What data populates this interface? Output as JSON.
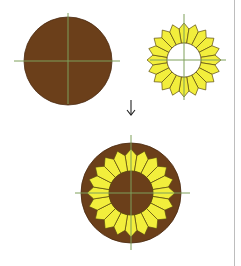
{
  "colors": {
    "brown": "#6b3f1a",
    "brown_edge": "#4a2a10",
    "yellow": "#f2ee3c",
    "petal_edge": "#5a4a10",
    "crosshair": "#7fa05a",
    "divider": "#bdbdbd",
    "arrow": "#222222"
  },
  "petal_count": 20,
  "figures": [
    {
      "id": "brown-disc",
      "cx": 68,
      "cy": 61,
      "disc_r": 44,
      "cross": {
        "x1": 14,
        "x2": 120,
        "y1": 13,
        "y2": 104
      }
    },
    {
      "id": "yellow-ring",
      "cx": 184,
      "cy": 60,
      "petal_inner_r": 17,
      "petal_outer_r": 37,
      "cross": {
        "x1": 150,
        "x2": 226,
        "y1": 14,
        "y2": 100
      }
    },
    {
      "id": "composite",
      "cx": 131,
      "cy": 193,
      "disc_r": 50,
      "petal_inner_r": 22,
      "petal_outer_r": 44,
      "center_r": 22,
      "cross": {
        "x1": 75,
        "x2": 190,
        "y1": 135,
        "y2": 250
      }
    }
  ],
  "arrow": {
    "glyph": "↓",
    "x": 131,
    "y1": 100,
    "y2": 115
  }
}
